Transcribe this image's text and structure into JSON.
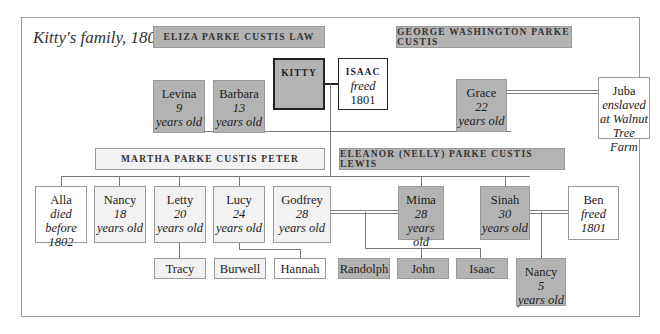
{
  "title": "Kitty's family, 1802",
  "colors": {
    "enslaved_fill": "#b3b3b3",
    "light_fill": "#f2f2f2",
    "free_fill": "#ffffff",
    "border": "#9a9a9a",
    "line": "#7a7a7a"
  },
  "owners": {
    "eliza": "ELIZA PARKE CUSTIS LAW",
    "george": "GEORGE WASHINGTON PARKE CUSTIS",
    "martha": "MARTHA PARKE CUSTIS PETER",
    "eleanor": "ELEANOR (NELLY) PARKE CUSTIS LEWIS"
  },
  "people": {
    "kitty": {
      "name": "KITTY"
    },
    "isaac_sr": {
      "name": "ISAAC",
      "line1": "freed",
      "line2": "1801"
    },
    "levina": {
      "name": "Levina",
      "age": "9",
      "unit": "years old"
    },
    "barbara": {
      "name": "Barbara",
      "age": "13",
      "unit": "years old"
    },
    "grace": {
      "name": "Grace",
      "age": "22",
      "unit": "years old"
    },
    "juba": {
      "name": "Juba",
      "line1": "enslaved",
      "line2": "at Walnut",
      "line3": "Tree Farm"
    },
    "alla": {
      "name": "Alla",
      "line1": "died before",
      "line2": "1802"
    },
    "nancy18": {
      "name": "Nancy",
      "age": "18",
      "unit": "years old"
    },
    "letty": {
      "name": "Letty",
      "age": "20",
      "unit": "years old"
    },
    "lucy": {
      "name": "Lucy",
      "age": "24",
      "unit": "years old"
    },
    "godfrey": {
      "name": "Godfrey",
      "age": "28",
      "unit": "years old"
    },
    "mima": {
      "name": "Mima",
      "age": "28",
      "unit": "years old"
    },
    "sinah": {
      "name": "Sinah",
      "age": "30",
      "unit": "years old"
    },
    "ben": {
      "name": "Ben",
      "line1": "freed",
      "line2": "1801"
    },
    "tracy": {
      "name": "Tracy"
    },
    "burwell": {
      "name": "Burwell"
    },
    "hannah": {
      "name": "Hannah"
    },
    "randolph": {
      "name": "Randolph"
    },
    "john": {
      "name": "John"
    },
    "isaac_jr": {
      "name": "Isaac"
    },
    "nancy5": {
      "name": "Nancy",
      "age": "5",
      "unit": "years old"
    }
  }
}
